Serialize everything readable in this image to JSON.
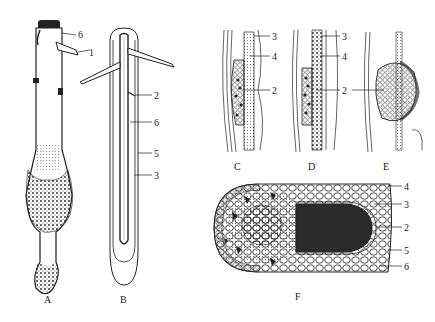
{
  "figure": {
    "panels": [
      {
        "id": "A",
        "caption": "A",
        "labels": [
          "6",
          "1"
        ]
      },
      {
        "id": "B",
        "caption": "B",
        "labels": [
          "2",
          "6",
          "5",
          "3"
        ]
      },
      {
        "id": "C",
        "caption": "C",
        "labels": [
          "3",
          "4",
          "2"
        ]
      },
      {
        "id": "D",
        "caption": "D",
        "labels": [
          "3",
          "4",
          "2"
        ]
      },
      {
        "id": "E",
        "caption": "E",
        "labels": []
      },
      {
        "id": "F",
        "caption": "F",
        "labels": [
          "4",
          "3",
          "2",
          "5",
          "6"
        ]
      }
    ],
    "shared_label_E": "2",
    "colors": {
      "ink": "#222222",
      "stipple": "#3a3a3a",
      "background": "#ffffff",
      "shade": "#9a9a9a"
    }
  }
}
